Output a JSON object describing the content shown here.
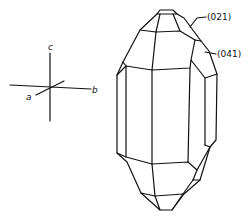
{
  "figure": {
    "type": "crystal-habit-drawing",
    "axes": {
      "a_label": "a",
      "b_label": "b",
      "c_label": "c"
    },
    "face_labels": [
      {
        "label": "(021)"
      },
      {
        "label": "(041)"
      }
    ]
  }
}
